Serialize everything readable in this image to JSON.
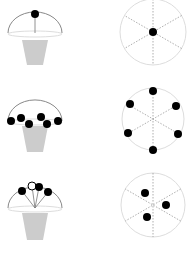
{
  "diagram": {
    "rows": [
      {
        "umbrella": {
          "base_y": 33,
          "cx": 35,
          "r": 27,
          "dots": [
            [
              35,
              14
            ]
          ],
          "lines": [
            [
              35,
              14,
              35,
              33
            ]
          ],
          "pot_top": 40,
          "pot_bottom": 65
        },
        "circle": {
          "cx": 153,
          "cy": 32,
          "r": 33,
          "dots": [
            [
              153,
              32
            ]
          ]
        }
      },
      {
        "umbrella": {
          "base_y": 121,
          "cx": 35,
          "r": 27,
          "dots": [
            [
              11,
              121
            ],
            [
              21,
              118
            ],
            [
              29,
              124
            ],
            [
              41,
              117
            ],
            [
              47,
              124
            ],
            [
              58,
              121
            ]
          ],
          "lines": [],
          "pot_top": 126,
          "pot_bottom": 152
        },
        "circle": {
          "cx": 153,
          "cy": 119,
          "r": 31,
          "dots": [
            [
              153,
              91
            ],
            [
              130,
              104
            ],
            [
              176,
              106
            ],
            [
              128,
              133
            ],
            [
              178,
              134
            ],
            [
              153,
              150
            ]
          ]
        }
      },
      {
        "umbrella": {
          "base_y": 208,
          "cx": 35,
          "r": 27,
          "dots": [
            [
              22,
              191
            ],
            [
              39,
              187
            ],
            [
              48,
              192
            ]
          ],
          "lines": [
            [
              22,
              191,
              35,
              208
            ],
            [
              32,
              186,
              35,
              208
            ],
            [
              39,
              187,
              35,
              208
            ],
            [
              48,
              192,
              35,
              208
            ]
          ],
          "pot_top": 213,
          "pot_bottom": 240
        },
        "circle": {
          "cx": 153,
          "cy": 205,
          "r": 32,
          "dots": [
            [
              145,
              193
            ],
            [
              166,
              205
            ],
            [
              147,
              217
            ]
          ]
        }
      }
    ],
    "colors": {
      "dot": "#000000",
      "dome": "#888888",
      "dome_base": "#dddddd",
      "pot": "#cccccc",
      "circle": "#dddddd",
      "dash": "#999999"
    }
  }
}
